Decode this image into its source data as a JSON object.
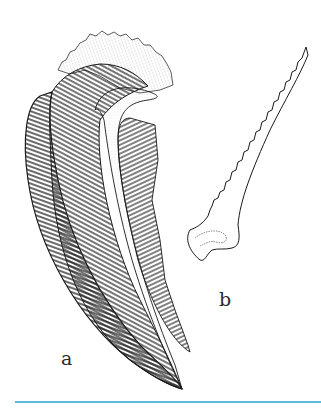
{
  "figure": {
    "labels": {
      "a": "a",
      "b": "b"
    },
    "colors": {
      "ink": "#1a1a1a",
      "stipple": "#777777",
      "rule": "#5bbbe0"
    }
  }
}
